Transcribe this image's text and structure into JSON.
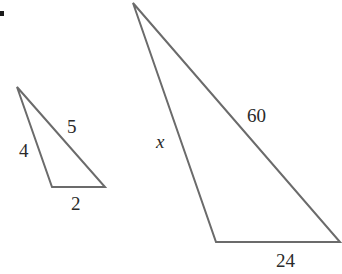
{
  "figure": {
    "bullet": "•",
    "small_triangle": {
      "vertices": [
        [
          17,
          87
        ],
        [
          52,
          187
        ],
        [
          105,
          187
        ]
      ],
      "labels": {
        "left_side": "4",
        "hypotenuse": "5",
        "base": "2"
      }
    },
    "large_triangle": {
      "vertices": [
        [
          133,
          3
        ],
        [
          216,
          242
        ],
        [
          340,
          242
        ]
      ],
      "labels": {
        "left_side": "x",
        "hypotenuse": "60",
        "base": "24"
      }
    },
    "colors": {
      "line": "#6b6b6b",
      "text": "#2a2a2a",
      "background": "#ffffff"
    }
  }
}
